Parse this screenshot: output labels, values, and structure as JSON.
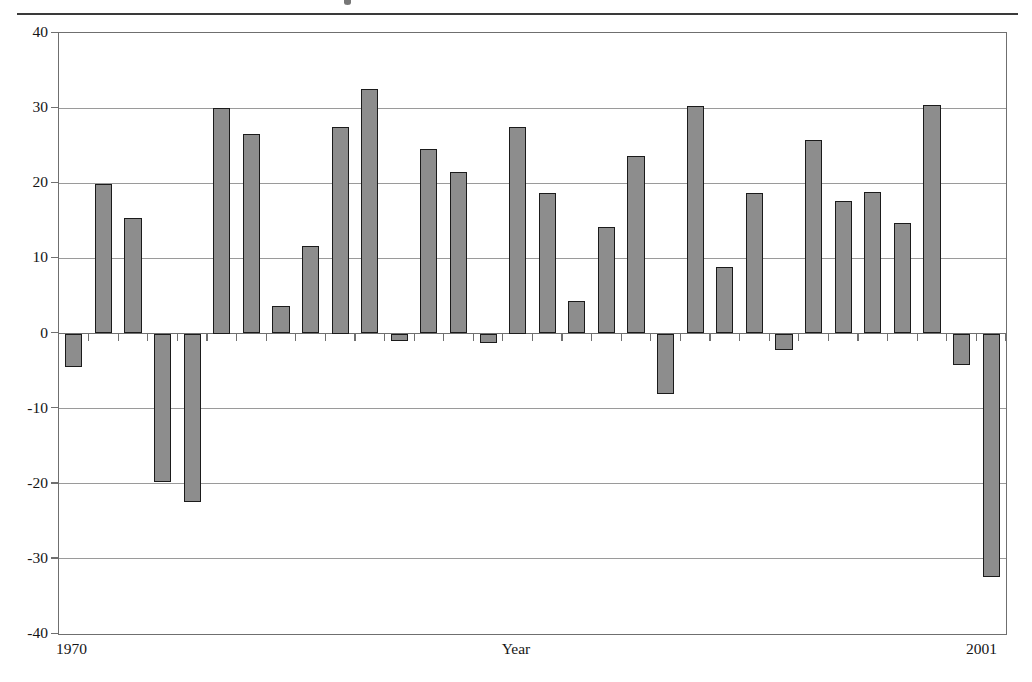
{
  "page": {
    "background_color": "#ffffff",
    "rule_color": "#3a3a3a"
  },
  "chart_data": {
    "type": "bar",
    "title": "",
    "subtitle": "",
    "xlabel": "Year",
    "ylabel": "",
    "xlim": [
      1970,
      2001
    ],
    "ylim": [
      -40,
      40
    ],
    "ytick_labels": [
      "40",
      "30",
      "20",
      "10",
      "0",
      "-10",
      "-20",
      "-30",
      "-40"
    ],
    "yticks": [
      40,
      30,
      20,
      10,
      0,
      -10,
      -20,
      -30,
      -40
    ],
    "xtick_labels": [
      "1970",
      "2001"
    ],
    "grid": true,
    "grid_axis": "y",
    "legend": false,
    "legend_position": "none",
    "bar_fill_color": "#8d8d8d",
    "bar_edge_color": "#1b1b1b",
    "axis_color": "#6f6f6f",
    "gridline_color": "#9a9a9a",
    "categories": [
      "1970",
      "1971",
      "1972",
      "1973",
      "1974",
      "1975",
      "1976",
      "1977",
      "1978",
      "1979",
      "1980",
      "1981",
      "1982",
      "1983",
      "1984",
      "1985",
      "1986",
      "1987",
      "1988",
      "1989",
      "1990",
      "1991",
      "1992",
      "1993",
      "1994",
      "1995",
      "1996",
      "1997",
      "1998",
      "1999",
      "2000",
      "2001"
    ],
    "values": [
      -4.5,
      19.9,
      15.4,
      -19.8,
      -22.4,
      30.0,
      26.5,
      3.6,
      11.6,
      27.5,
      32.6,
      -1.0,
      24.6,
      21.5,
      -1.2,
      27.5,
      18.7,
      4.3,
      14.2,
      23.6,
      -8.0,
      30.3,
      8.8,
      18.7,
      -2.2,
      25.8,
      17.7,
      18.8,
      14.7,
      30.4,
      -4.2,
      -32.4
    ]
  },
  "axis_text": {
    "x_start": "1970",
    "x_end": "2001",
    "x_title": "Year"
  }
}
